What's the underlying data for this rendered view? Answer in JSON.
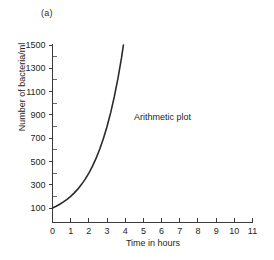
{
  "figure": {
    "panel_label": "(a)",
    "annotation": "Arithmetic plot",
    "background_color": "#ffffff",
    "curve_color": "#2a2a2a",
    "axis_color": "#3a3a3a"
  },
  "chart_data": {
    "type": "line",
    "title": "",
    "subtitle": "",
    "xlabel": "Time in hours",
    "ylabel": "Number of bacteria/ml",
    "xlim": [
      0,
      11
    ],
    "ylim": [
      0,
      1500
    ],
    "grid": false,
    "legend": null,
    "annotations": [
      {
        "text": "Arithmetic plot",
        "x": 5.0,
        "y": 800
      }
    ],
    "xticks": [
      0,
      1,
      2,
      3,
      4,
      5,
      6,
      7,
      8,
      9,
      10,
      11
    ],
    "xticklabels": [
      "0",
      "1",
      "2",
      "3",
      "4",
      "5",
      "6",
      "7",
      "8",
      "9",
      "10",
      "11"
    ],
    "yticks": [
      100,
      300,
      500,
      700,
      900,
      1100,
      1300,
      1500
    ],
    "yticklabels": [
      "100",
      "300",
      "500",
      "700",
      "900",
      "1100",
      "1300",
      "1500"
    ],
    "yticks_minor": [
      200,
      400,
      600,
      800,
      1000,
      1200,
      1400
    ],
    "series": [
      {
        "name": "Arithmetic plot",
        "color": "#2a2a2a",
        "x": [
          0.0,
          0.2,
          0.4,
          0.6,
          0.8,
          1.0,
          1.2,
          1.4,
          1.6,
          1.8,
          2.0,
          2.2,
          2.4,
          2.6,
          2.8,
          3.0,
          3.2,
          3.4,
          3.6,
          3.8,
          3.9
        ],
        "y": [
          100,
          115,
          132,
          152,
          174,
          200,
          230,
          264,
          303,
          348,
          400,
          460,
          528,
          607,
          697,
          800,
          919,
          1056,
          1213,
          1393,
          1500
        ]
      }
    ]
  }
}
